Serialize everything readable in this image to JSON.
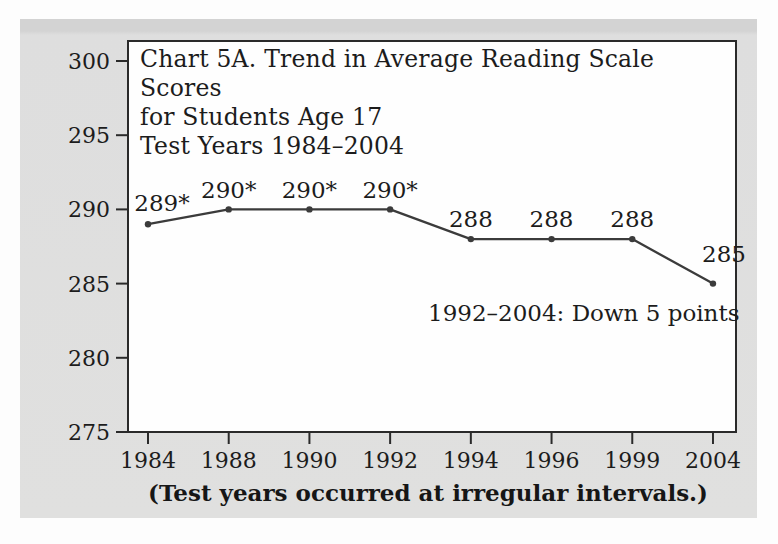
{
  "colors": {
    "panel_bg": "#dedede",
    "panel_top_band": "#d3d3d3",
    "plot_bg": "#fefefe",
    "plot_border": "#2a2a2a",
    "line": "#3b3b3b",
    "marker": "#3b3b3b",
    "text": "#1c1c1c"
  },
  "chart_data": {
    "type": "line",
    "title_lines": [
      "Chart 5A. Trend in Average Reading Scale Scores",
      "for Students Age 17",
      "Test Years 1984–2004"
    ],
    "categories": [
      "1984",
      "1988",
      "1990",
      "1992",
      "1994",
      "1996",
      "1999",
      "2004"
    ],
    "values": [
      289,
      290,
      290,
      290,
      288,
      288,
      288,
      285
    ],
    "point_labels": [
      "289*",
      "290*",
      "290*",
      "290*",
      "288",
      "288",
      "288",
      "285"
    ],
    "yticks": [
      300,
      295,
      290,
      285,
      280,
      275
    ],
    "ylim": [
      275,
      300
    ],
    "xlabel": "",
    "ylabel": "",
    "grid": "off",
    "legend": "none",
    "annotation": "1992–2004: Down 5 points",
    "caption": "(Test years occurred at irregular intervals.)",
    "layout_hints": {
      "x_spacing": "categories evenly spaced despite irregular year intervals",
      "point_label_offsets": [
        {
          "dx": 14,
          "dy": -13
        },
        {
          "dx": 0,
          "dy": -11
        },
        {
          "dx": 0,
          "dy": -11
        },
        {
          "dx": 0,
          "dy": -11
        },
        {
          "dx": 0,
          "dy": -12
        },
        {
          "dx": 0,
          "dy": -12
        },
        {
          "dx": 0,
          "dy": -12
        },
        {
          "dx": 11,
          "dy": -22
        }
      ]
    }
  }
}
